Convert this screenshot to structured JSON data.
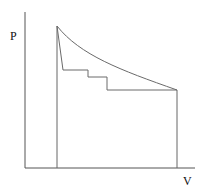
{
  "diagram": {
    "type": "P-V diagram",
    "y_axis_label": "P",
    "x_axis_label": "V",
    "colors": {
      "axes": "#555555",
      "curve": "#6a6a6a"
    },
    "paths": {
      "axes": "M25,12 L25,168 L195,168",
      "left_vertical": "M57,26 L57,168",
      "right_vertical": "M177,90 L177,168",
      "curve": "M57,26 C80,55 120,70 177,90",
      "steps": "M57,26 L63,70 L88,70 L88,77 L107,77 L107,90 L177,90"
    }
  }
}
